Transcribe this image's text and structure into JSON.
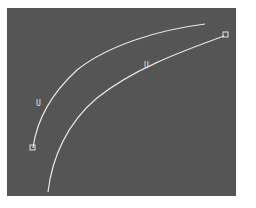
{
  "canvas": {
    "background": "#555555",
    "stroke_color": "#e6e6e6"
  },
  "curves": [
    {
      "name": "upper-curve",
      "start_marker": "square",
      "start": [
        33,
        148
      ],
      "end": [
        205,
        24
      ],
      "label": "U",
      "label_pos": [
        36,
        100
      ]
    },
    {
      "name": "lower-curve",
      "start": [
        48,
        192
      ],
      "end": [
        226,
        35
      ],
      "end_marker": "square",
      "label": "U",
      "label_pos": [
        144,
        62
      ]
    }
  ]
}
